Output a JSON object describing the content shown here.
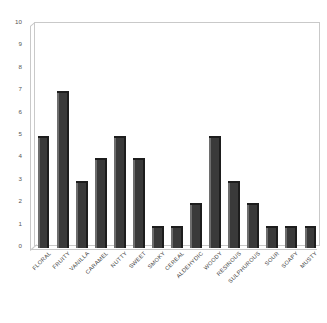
{
  "chart_data": {
    "type": "bar",
    "title": "",
    "subtitle": "",
    "xlabel": "",
    "ylabel": "",
    "ylim": [
      0,
      10
    ],
    "yticks": [
      0,
      1,
      2,
      3,
      4,
      5,
      6,
      7,
      8,
      9,
      10
    ],
    "grid": false,
    "legend": "none",
    "categories": [
      "FLORAL",
      "FRUITY",
      "VANILLA",
      "CARAMEL",
      "NUTTY",
      "SWEET",
      "SMOKY",
      "CEREAL",
      "ALDEHYDIC",
      "WOODY",
      "RESINOUS",
      "SULPHUROUS",
      "SOUR",
      "SOAPY",
      "MUSTY"
    ],
    "values": [
      5,
      7,
      3,
      4,
      5,
      4,
      1,
      1,
      2,
      5,
      3,
      2,
      1,
      1,
      1
    ]
  },
  "style": {
    "bar_color": "#3a3a3a",
    "bar_highlight_color": "#6e6e6e",
    "bar_shadow_color": "#1d1d1d",
    "frame_color": "#c9c9c9",
    "background_color": "#ffffff",
    "tick_text_color": "#555555",
    "label_text_color": "#3d3d3d"
  }
}
